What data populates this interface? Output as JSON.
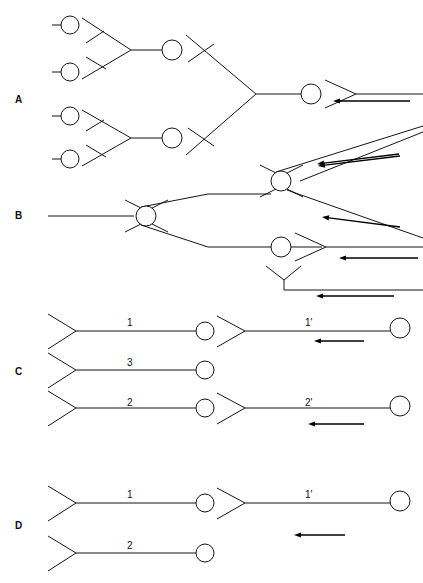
{
  "figure": {
    "background_color": "#ffffff",
    "line_color": "#151515",
    "arrow_color": "#000000",
    "width": 423,
    "height": 583
  },
  "panels": [
    {
      "id": "A",
      "label": "A",
      "x": 15,
      "y": 95
    },
    {
      "id": "B",
      "label": "B",
      "x": 15,
      "y": 211
    },
    {
      "id": "C",
      "label": "C",
      "x": 15,
      "y": 367
    },
    {
      "id": "D",
      "label": "D",
      "x": 15,
      "y": 521
    }
  ],
  "segment_labels": [
    {
      "id": "c1",
      "text": "1",
      "x": 127,
      "y": 318
    },
    {
      "id": "c1p",
      "text": "1'",
      "x": 305,
      "y": 318
    },
    {
      "id": "c3",
      "text": "3",
      "x": 127,
      "y": 358
    },
    {
      "id": "c2",
      "text": "2",
      "x": 127,
      "y": 398
    },
    {
      "id": "c2p",
      "text": "2'",
      "x": 305,
      "y": 398
    },
    {
      "id": "d1",
      "text": "1",
      "x": 127,
      "y": 490
    },
    {
      "id": "d1p",
      "text": "1'",
      "x": 305,
      "y": 490
    },
    {
      "id": "d2",
      "text": "2",
      "x": 127,
      "y": 541
    }
  ],
  "bubbles": [
    {
      "panel": "A",
      "cx": 70,
      "cy": 25,
      "r": 9
    },
    {
      "panel": "A",
      "cx": 70,
      "cy": 72,
      "r": 9
    },
    {
      "panel": "A",
      "cx": 70,
      "cy": 116,
      "r": 9
    },
    {
      "panel": "A",
      "cx": 70,
      "cy": 159,
      "r": 9
    },
    {
      "panel": "A",
      "cx": 172,
      "cy": 50,
      "r": 10
    },
    {
      "panel": "A",
      "cx": 172,
      "cy": 138,
      "r": 10
    },
    {
      "panel": "A",
      "cx": 311,
      "cy": 94,
      "r": 10
    },
    {
      "panel": "B",
      "cx": 146,
      "cy": 216,
      "r": 10
    },
    {
      "panel": "B",
      "cx": 281,
      "cy": 181,
      "r": 10
    },
    {
      "panel": "B",
      "cx": 281,
      "cy": 247,
      "r": 10
    },
    {
      "panel": "C",
      "cx": 205,
      "cy": 331,
      "r": 9
    },
    {
      "panel": "C",
      "cx": 205,
      "cy": 370,
      "r": 9
    },
    {
      "panel": "C",
      "cx": 205,
      "cy": 408,
      "r": 9
    },
    {
      "panel": "C",
      "cx": 400,
      "cy": 328,
      "r": 10
    },
    {
      "panel": "C",
      "cx": 400,
      "cy": 406,
      "r": 10
    },
    {
      "panel": "D",
      "cx": 205,
      "cy": 503,
      "r": 9
    },
    {
      "panel": "D",
      "cx": 400,
      "cy": 501,
      "r": 10
    },
    {
      "panel": "D",
      "cx": 205,
      "cy": 553,
      "r": 9
    }
  ],
  "arrows": [
    {
      "panel": "A",
      "from_x": 410,
      "from_y": 101,
      "to_x": 333,
      "to_y": 101,
      "direction": "left"
    },
    {
      "panel": "A",
      "from_x": 400,
      "from_y": 156,
      "to_x": 318,
      "to_y": 166,
      "direction": "left"
    },
    {
      "panel": "B",
      "from_x": 399,
      "from_y": 154,
      "to_x": 317,
      "to_y": 164,
      "direction": "left"
    },
    {
      "panel": "B",
      "from_x": 400,
      "from_y": 227,
      "to_x": 322,
      "to_y": 217,
      "direction": "left"
    },
    {
      "panel": "B",
      "from_x": 418,
      "from_y": 258,
      "to_x": 339,
      "to_y": 258,
      "direction": "left"
    },
    {
      "panel": "B",
      "from_x": 394,
      "from_y": 296,
      "to_x": 316,
      "to_y": 296,
      "direction": "left"
    },
    {
      "panel": "C",
      "from_x": 364,
      "from_y": 341,
      "to_x": 314,
      "to_y": 341,
      "direction": "left"
    },
    {
      "panel": "C",
      "from_x": 364,
      "from_y": 424,
      "to_x": 308,
      "to_y": 424,
      "direction": "left"
    },
    {
      "panel": "D",
      "from_x": 345,
      "from_y": 535,
      "to_x": 294,
      "to_y": 535,
      "direction": "left"
    }
  ],
  "counts": {
    "panels": 4,
    "bubbles": 18,
    "arrows": 9,
    "segment_labels": 8
  }
}
